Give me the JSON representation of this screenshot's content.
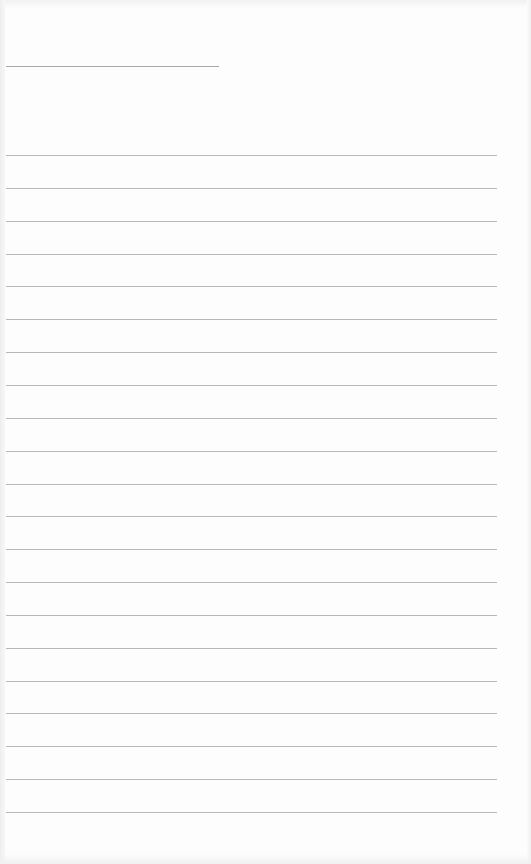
{
  "page": {
    "type": "ruled-notebook-page",
    "background": "#fdfdfd",
    "line_color": "#a6a6a6",
    "title_line": {
      "x": 6,
      "y": 66,
      "width": 213
    },
    "rules": {
      "count": 21,
      "x": 6,
      "width": 491,
      "first_y": 155,
      "spacing": 32.85
    },
    "text_content": []
  }
}
